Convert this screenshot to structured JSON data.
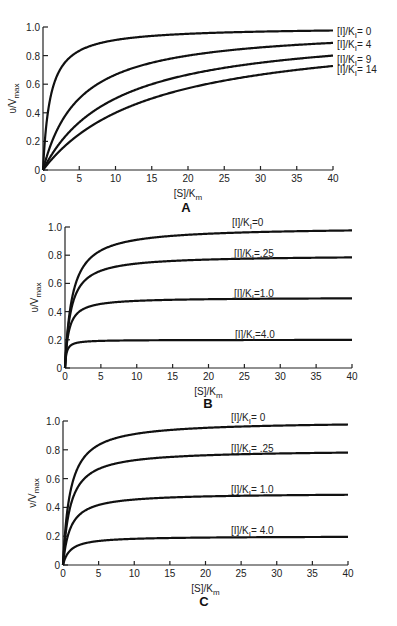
{
  "chart_data": [
    {
      "panel": "A",
      "type": "line",
      "title": "A",
      "xlabel": "[S]/Km",
      "ylabel": "v/Vmax",
      "xlim": [
        0,
        40
      ],
      "ylim": [
        0,
        1.0
      ],
      "xticks": [
        "0",
        "5",
        "10",
        "15",
        "20",
        "25",
        "30",
        "35",
        "40"
      ],
      "yticks": [
        "0",
        "0.2",
        "0.4",
        "0.6",
        "0.8",
        "1.0"
      ],
      "grid": false,
      "legend_position": "right-inline",
      "model": "competitive",
      "series": [
        {
          "name": "[I]/KI = 0",
          "i": 0,
          "x": [
            0,
            1,
            2,
            3,
            5,
            10,
            15,
            20,
            25,
            30,
            35,
            40
          ],
          "values": [
            0,
            0.5,
            0.67,
            0.75,
            0.83,
            0.91,
            0.94,
            0.95,
            0.96,
            0.97,
            0.97,
            0.98
          ]
        },
        {
          "name": "[I]/KI = 4",
          "i": 4,
          "x": [
            0,
            1,
            2,
            3,
            5,
            10,
            15,
            20,
            25,
            30,
            35,
            40
          ],
          "values": [
            0,
            0.17,
            0.29,
            0.38,
            0.5,
            0.67,
            0.75,
            0.8,
            0.83,
            0.86,
            0.88,
            0.89
          ]
        },
        {
          "name": "[I]/KI = 9",
          "i": 9,
          "x": [
            0,
            1,
            2,
            3,
            5,
            10,
            15,
            20,
            25,
            30,
            35,
            40
          ],
          "values": [
            0,
            0.09,
            0.17,
            0.23,
            0.33,
            0.5,
            0.6,
            0.67,
            0.71,
            0.75,
            0.78,
            0.8
          ]
        },
        {
          "name": "[I]/KI = 14",
          "i": 14,
          "x": [
            0,
            1,
            2,
            3,
            5,
            10,
            15,
            20,
            25,
            30,
            35,
            40
          ],
          "values": [
            0,
            0.06,
            0.12,
            0.17,
            0.25,
            0.4,
            0.5,
            0.57,
            0.63,
            0.67,
            0.7,
            0.73
          ]
        }
      ]
    },
    {
      "panel": "B",
      "type": "line",
      "title": "B",
      "xlabel": "[S]/Km",
      "ylabel": "v/Vmax",
      "xlim": [
        0,
        40
      ],
      "ylim": [
        0,
        1.0
      ],
      "xticks": [
        "0",
        "5",
        "10",
        "15",
        "20",
        "25",
        "30",
        "35",
        "40"
      ],
      "yticks": [
        "0",
        "0.2",
        "0.4",
        "0.6",
        "0.8",
        "1.0"
      ],
      "grid": false,
      "legend_position": "above-curves",
      "model": "uncompetitive",
      "series": [
        {
          "name": "[I]/KI = 0",
          "i": 0,
          "x": [
            0,
            1,
            2,
            3,
            5,
            10,
            15,
            20,
            25,
            30,
            35,
            40
          ],
          "values": [
            0,
            0.5,
            0.67,
            0.75,
            0.83,
            0.91,
            0.94,
            0.95,
            0.96,
            0.97,
            0.97,
            0.98
          ]
        },
        {
          "name": "[I]/KI = .25",
          "i": 0.25,
          "x": [
            0,
            1,
            2,
            3,
            5,
            10,
            15,
            20,
            25,
            30,
            35,
            40
          ],
          "values": [
            0,
            0.44,
            0.57,
            0.63,
            0.69,
            0.74,
            0.76,
            0.77,
            0.78,
            0.78,
            0.78,
            0.78
          ]
        },
        {
          "name": "[I]/KI = 1.0",
          "i": 1.0,
          "x": [
            0,
            1,
            2,
            3,
            5,
            10,
            15,
            20,
            25,
            30,
            35,
            40
          ],
          "values": [
            0,
            0.33,
            0.4,
            0.43,
            0.45,
            0.48,
            0.48,
            0.49,
            0.49,
            0.49,
            0.49,
            0.49
          ]
        },
        {
          "name": "[I]/KI = 4.0",
          "i": 4.0,
          "x": [
            0,
            1,
            2,
            3,
            5,
            10,
            15,
            20,
            25,
            30,
            35,
            40
          ],
          "values": [
            0,
            0.17,
            0.18,
            0.19,
            0.19,
            0.2,
            0.2,
            0.2,
            0.2,
            0.2,
            0.2,
            0.2
          ]
        }
      ]
    },
    {
      "panel": "C",
      "type": "line",
      "title": "C",
      "xlabel": "[S]/Km",
      "ylabel": "v/Vmax",
      "xlim": [
        0,
        40
      ],
      "ylim": [
        0,
        1.0
      ],
      "xticks": [
        "0",
        "5",
        "10",
        "15",
        "20",
        "25",
        "30",
        "35",
        "40"
      ],
      "yticks": [
        "0",
        "0.2",
        "0.4",
        "0.6",
        "0.8",
        "1.0"
      ],
      "grid": false,
      "legend_position": "above-curves",
      "model": "noncompetitive",
      "series": [
        {
          "name": "[I]/KI = 0",
          "i": 0,
          "x": [
            0,
            1,
            2,
            3,
            5,
            10,
            15,
            20,
            25,
            30,
            35,
            40
          ],
          "values": [
            0,
            0.5,
            0.67,
            0.75,
            0.83,
            0.91,
            0.94,
            0.95,
            0.96,
            0.97,
            0.97,
            0.98
          ]
        },
        {
          "name": "[I]/KI = .25",
          "i": 0.25,
          "x": [
            0,
            1,
            2,
            3,
            5,
            10,
            15,
            20,
            25,
            30,
            35,
            40
          ],
          "values": [
            0,
            0.4,
            0.53,
            0.6,
            0.67,
            0.73,
            0.75,
            0.76,
            0.77,
            0.77,
            0.78,
            0.78
          ]
        },
        {
          "name": "[I]/KI = 1.0",
          "i": 1.0,
          "x": [
            0,
            1,
            2,
            3,
            5,
            10,
            15,
            20,
            25,
            30,
            35,
            40
          ],
          "values": [
            0,
            0.25,
            0.33,
            0.38,
            0.42,
            0.45,
            0.47,
            0.48,
            0.48,
            0.48,
            0.49,
            0.49
          ]
        },
        {
          "name": "[I]/KI = 4.0",
          "i": 4.0,
          "x": [
            0,
            1,
            2,
            3,
            5,
            10,
            15,
            20,
            25,
            30,
            35,
            40
          ],
          "values": [
            0,
            0.1,
            0.13,
            0.15,
            0.17,
            0.18,
            0.19,
            0.19,
            0.19,
            0.19,
            0.19,
            0.2
          ]
        }
      ]
    }
  ],
  "panels": {
    "A": {
      "label": "A",
      "xlabel": "[S]/K",
      "xlabel_sub": "m",
      "ylabel": "υ/V",
      "ylabel_sub": "max",
      "legend": [
        {
          "pre": "[I]/K",
          "sub": "I",
          "post": "= 0"
        },
        {
          "pre": "[I]/K",
          "sub": "I",
          "post": "= 4"
        },
        {
          "pre": "[I]/K",
          "sub": "I",
          "post": "= 9"
        },
        {
          "pre": "[I]/K",
          "sub": "I",
          "post": "= 14"
        }
      ]
    },
    "B": {
      "label": "B",
      "xlabel": "[S]/K",
      "xlabel_sub": "m",
      "ylabel": "υ/V",
      "ylabel_sub": "max",
      "legend": [
        {
          "pre": "[I]/K",
          "sub": "I",
          "post": "=0"
        },
        {
          "pre": "[I]/K",
          "sub": "I",
          "post": "=.25"
        },
        {
          "pre": "[I]/K",
          "sub": "I",
          "post": "=1.0"
        },
        {
          "pre": "[I]/K",
          "sub": "I",
          "post": "=4.0"
        }
      ]
    },
    "C": {
      "label": "C",
      "xlabel": "[S]/K",
      "xlabel_sub": "m",
      "ylabel": "ν/V",
      "ylabel_sub": "max",
      "legend": [
        {
          "pre": "[I]/K",
          "sub": "I",
          "post": "= 0"
        },
        {
          "pre": "[I]/K",
          "sub": "I",
          "post": "= .25"
        },
        {
          "pre": "[I]/K",
          "sub": "I",
          "post": "= 1.0"
        },
        {
          "pre": "[I]/K",
          "sub": "I",
          "post": "= 4.0"
        }
      ]
    }
  }
}
